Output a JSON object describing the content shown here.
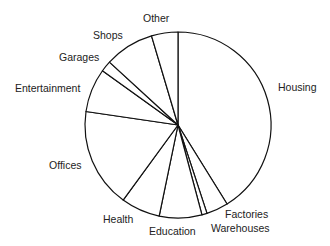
{
  "chart_data": {
    "type": "pie",
    "title": "",
    "start_angle_deg": 0,
    "direction": "clockwise",
    "units": "percent (estimated from slice angles)",
    "categories": [
      "Housing",
      "Factories",
      "Warehouses",
      "Education",
      "Health",
      "Offices",
      "Entertainment",
      "Garages",
      "Shops",
      "Other"
    ],
    "values": [
      41.2,
      3.8,
      0.9,
      7.4,
      6.8,
      17.3,
      7.6,
      1.9,
      8.6,
      4.6
    ],
    "colors": {
      "fill": "#ffffff",
      "stroke": "#111111"
    },
    "legend": "none (labels placed outside slices)"
  },
  "labels": [
    {
      "text": "Housing",
      "x": 278,
      "y": 81
    },
    {
      "text": "Factories",
      "x": 225,
      "y": 208
    },
    {
      "text": "Warehouses",
      "x": 211,
      "y": 222
    },
    {
      "text": "Education",
      "x": 149,
      "y": 225
    },
    {
      "text": "Health",
      "x": 103,
      "y": 213
    },
    {
      "text": "Offices",
      "x": 49,
      "y": 159
    },
    {
      "text": "Entertainment",
      "x": 15,
      "y": 82
    },
    {
      "text": "Garages",
      "x": 59,
      "y": 51
    },
    {
      "text": "Shops",
      "x": 93,
      "y": 29
    },
    {
      "text": "Other",
      "x": 143,
      "y": 12
    }
  ],
  "geometry": {
    "cx": 178,
    "cy": 125,
    "r": 93
  }
}
